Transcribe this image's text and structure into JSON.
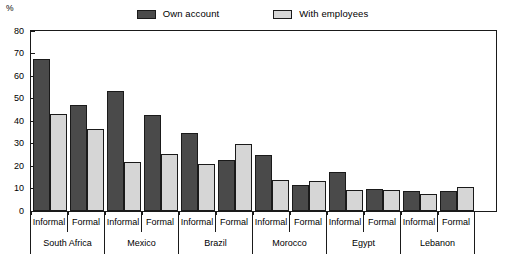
{
  "legend": {
    "items": [
      {
        "label": "Own account",
        "color": "#4a4a4a",
        "key": "own"
      },
      {
        "label": "With employees",
        "color": "#d6d6d6",
        "key": "emp"
      }
    ]
  },
  "axis": {
    "unit": "%",
    "y_ticks": [
      "0",
      "10",
      "20",
      "30",
      "40",
      "50",
      "60",
      "70",
      "80"
    ]
  },
  "chart_data": {
    "type": "bar",
    "title": "",
    "subtitle": "",
    "xlabel": "",
    "ylabel": "%",
    "ylim": [
      0,
      80
    ],
    "ytick_step": 10,
    "grid": false,
    "legend_position": "top-center",
    "orientation": "vertical",
    "grouping": "country > sector",
    "categories": [
      "South Africa Informal",
      "South Africa Formal",
      "Mexico Informal",
      "Mexico Formal",
      "Brazil Informal",
      "Brazil Formal",
      "Morocco Informal",
      "Morocco Formal",
      "Egypt Informal",
      "Egypt Formal",
      "Lebanon Informal",
      "Lebanon Formal"
    ],
    "series": [
      {
        "name": "Own account",
        "color": "#4a4a4a",
        "values": [
          67.5,
          47,
          53.5,
          42.5,
          34.5,
          22.5,
          25,
          11.5,
          17.5,
          10,
          9,
          9
        ]
      },
      {
        "name": "With employees",
        "color": "#d6d6d6",
        "values": [
          43,
          36.5,
          22,
          25.5,
          21,
          30,
          14,
          13.5,
          9.5,
          9.5,
          7.5,
          10.5
        ]
      }
    ],
    "countries": [
      {
        "name": "South Africa",
        "sectors": [
          {
            "label": "Informal",
            "own": 67.5,
            "emp": 43
          },
          {
            "label": "Formal",
            "own": 47,
            "emp": 36.5
          }
        ]
      },
      {
        "name": "Mexico",
        "sectors": [
          {
            "label": "Informal",
            "own": 53.5,
            "emp": 22
          },
          {
            "label": "Formal",
            "own": 42.5,
            "emp": 25.5
          }
        ]
      },
      {
        "name": "Brazil",
        "sectors": [
          {
            "label": "Informal",
            "own": 34.5,
            "emp": 21
          },
          {
            "label": "Formal",
            "own": 22.5,
            "emp": 30
          }
        ]
      },
      {
        "name": "Morocco",
        "sectors": [
          {
            "label": "Informal",
            "own": 25,
            "emp": 14
          },
          {
            "label": "Formal",
            "own": 11.5,
            "emp": 13.5
          }
        ]
      },
      {
        "name": "Egypt",
        "sectors": [
          {
            "label": "Informal",
            "own": 17.5,
            "emp": 9.5
          },
          {
            "label": "Formal",
            "own": 10,
            "emp": 9.5
          }
        ]
      },
      {
        "name": "Lebanon",
        "sectors": [
          {
            "label": "Informal",
            "own": 9,
            "emp": 7.5
          },
          {
            "label": "Formal",
            "own": 9,
            "emp": 10.5
          }
        ]
      }
    ]
  }
}
